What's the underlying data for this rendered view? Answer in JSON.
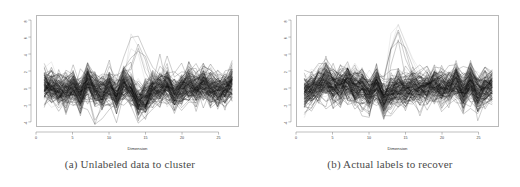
{
  "figure": {
    "panel_count": 2,
    "background_color": "#ffffff",
    "frame_color": "#b9b9b9"
  },
  "panels": [
    {
      "caption": "(a) Unlabeled data to cluster",
      "caption_tag": "(a)",
      "caption_text": "Unlabeled data to cluster"
    },
    {
      "caption": "(b) Actual labels to recover",
      "caption_tag": "(b)",
      "caption_text": "Actual labels to recover"
    }
  ],
  "chart_data": [
    {
      "type": "line",
      "title": "",
      "subtitle": "",
      "caption": "(a) Unlabeled data to cluster",
      "xlabel": "Dimension",
      "ylabel": "",
      "xlim": [
        0,
        27.8
      ],
      "ylim": [
        -4.6,
        8.6
      ],
      "xticks": [
        0,
        5,
        10,
        15,
        20,
        25
      ],
      "xticklabels": [
        "0",
        "5",
        "10",
        "15",
        "20",
        "25"
      ],
      "yticks": [
        -4,
        -2,
        0,
        2,
        4,
        6,
        8
      ],
      "yticklabels": [
        "-4",
        "-2",
        "0",
        "2",
        "4",
        "6",
        "8"
      ],
      "grid": false,
      "legend": "none",
      "x": [
        1,
        2,
        3,
        4,
        5,
        6,
        7,
        8,
        9,
        10,
        11,
        12,
        13,
        14,
        15,
        16,
        17,
        18,
        19,
        20,
        21,
        22,
        23,
        24,
        25,
        26,
        27
      ],
      "series_count": 150,
      "line_color": "#000000",
      "line_width": 0.35,
      "series_summary": {
        "center_mean": 0.0,
        "core_band": [
          -2.0,
          2.0
        ],
        "outlier_peak_value": 8.2,
        "outlier_peak_dimension": 14,
        "outlier_low_value": -4.2,
        "outlier_low_dimension": 8
      },
      "series": [
        {
          "name": "profile-mean",
          "values": [
            0.35,
            0.15,
            0.05,
            -0.1,
            0.2,
            0.4,
            0.05,
            -0.35,
            -0.2,
            0.15,
            0.35,
            0.2,
            0.45,
            0.9,
            0.25,
            0.35,
            0.1,
            0.45,
            0.2,
            0.3,
            0.1,
            -0.05,
            0.45,
            0.2,
            0.35,
            0.25,
            0.3
          ]
        },
        {
          "name": "profile-upper",
          "values": [
            1.9,
            2.3,
            1.8,
            1.7,
            2.2,
            2.6,
            1.9,
            1.6,
            1.8,
            2.4,
            2.9,
            2.7,
            3.3,
            7.9,
            2.6,
            2.1,
            2.0,
            2.5,
            2.1,
            2.4,
            2.1,
            1.9,
            2.6,
            2.2,
            2.9,
            2.0,
            2.3
          ]
        },
        {
          "name": "profile-lower",
          "values": [
            -1.8,
            -2.3,
            -1.9,
            -1.8,
            -1.9,
            -1.7,
            -2.6,
            -4.2,
            -2.2,
            -2.0,
            -1.9,
            -2.4,
            -2.7,
            -2.0,
            -2.2,
            -2.1,
            -1.9,
            -2.2,
            -2.0,
            -2.3,
            -2.4,
            -2.5,
            -1.9,
            -2.1,
            -2.0,
            -2.2,
            -2.3
          ]
        }
      ]
    },
    {
      "type": "line",
      "title": "",
      "subtitle": "",
      "caption": "(b) Actual labels to recover",
      "xlabel": "Dimension",
      "ylabel": "",
      "xlim": [
        0,
        27.8
      ],
      "ylim": [
        -4.6,
        8.6
      ],
      "xticks": [
        0,
        5,
        10,
        15,
        20,
        25
      ],
      "xticklabels": [
        "0",
        "5",
        "10",
        "15",
        "20",
        "25"
      ],
      "yticks": [
        -4,
        -2,
        0,
        2,
        4,
        6,
        8
      ],
      "yticklabels": [
        "-4",
        "-2",
        "0",
        "2",
        "4",
        "6",
        "8"
      ],
      "grid": false,
      "legend": "none",
      "x": [
        1,
        2,
        3,
        4,
        5,
        6,
        7,
        8,
        9,
        10,
        11,
        12,
        13,
        14,
        15,
        16,
        17,
        18,
        19,
        20,
        21,
        22,
        23,
        24,
        25,
        26,
        27
      ],
      "series_count": 150,
      "line_color": "#000000",
      "line_width": 0.35,
      "series_summary": {
        "center_mean": 0.0,
        "core_band": [
          -2.0,
          2.0
        ],
        "outlier_peak_value": 8.3,
        "outlier_peak_dimension": 14,
        "outlier_low_value": -4.2,
        "outlier_low_dimension": 9
      },
      "series": [
        {
          "name": "group-dark-mean",
          "values": [
            0.9,
            0.5,
            0.1,
            -0.4,
            0.5,
            0.8,
            0.1,
            -0.8,
            -0.5,
            0.1,
            0.7,
            0.3,
            0.8,
            1.4,
            0.3,
            0.8,
            0.1,
            0.9,
            0.3,
            0.7,
            0.2,
            -0.2,
            1.0,
            0.4,
            0.8,
            0.4,
            0.6
          ]
        },
        {
          "name": "group-light-mean",
          "values": [
            1.6,
            2.0,
            1.5,
            1.2,
            1.9,
            2.2,
            1.4,
            1.0,
            1.3,
            2.1,
            2.5,
            2.3,
            3.0,
            7.9,
            2.2,
            1.8,
            1.6,
            2.1,
            1.7,
            2.0,
            1.7,
            1.5,
            2.3,
            1.9,
            2.5,
            1.7,
            2.0
          ]
        },
        {
          "name": "group-lower",
          "values": [
            -1.9,
            -2.4,
            -2.0,
            -1.9,
            -2.0,
            -1.8,
            -2.7,
            -3.4,
            -4.2,
            -2.1,
            -2.0,
            -2.5,
            -2.8,
            -2.1,
            -2.3,
            -2.2,
            -2.0,
            -2.3,
            -2.1,
            -2.4,
            -2.5,
            -2.6,
            -2.0,
            -2.2,
            -2.1,
            -2.3,
            -2.4
          ]
        }
      ]
    }
  ]
}
